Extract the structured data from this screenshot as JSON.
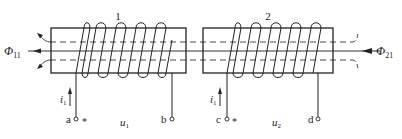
{
  "diagram": {
    "type": "two coupled coils on separate cores (mutual inductance / dot convention)",
    "colors": {
      "stroke": "#222222",
      "background": "#ffffff"
    },
    "coils": [
      {
        "id": "coil-1",
        "label": "1",
        "turns": 5,
        "terminals": [
          {
            "name": "a",
            "dot_mark": "*"
          },
          {
            "name": "b"
          }
        ],
        "current": {
          "symbol": "i",
          "subscript": "1"
        },
        "voltage": {
          "symbol": "u",
          "subscript": "1"
        },
        "flux": {
          "symbol": "Φ",
          "subscript": "11",
          "direction": "left"
        }
      },
      {
        "id": "coil-2",
        "label": "2",
        "turns": 5,
        "terminals": [
          {
            "name": "c",
            "dot_mark": "*"
          },
          {
            "name": "d"
          }
        ],
        "current": {
          "symbol": "i",
          "subscript": "1"
        },
        "voltage": {
          "symbol": "u",
          "subscript": "2"
        },
        "flux": {
          "symbol": "Φ",
          "subscript": "21",
          "direction": "left"
        }
      }
    ]
  },
  "labels": {
    "coil1_number": "1",
    "coil2_number": "2",
    "flux_left_symbol": "Φ",
    "flux_left_sub": "11",
    "flux_right_symbol": "Φ",
    "flux_right_sub": "21",
    "current1_symbol": "i",
    "current1_sub": "1",
    "current2_symbol": "i",
    "current2_sub": "1",
    "term_a": "a",
    "term_b": "b",
    "term_c": "c",
    "term_d": "d",
    "dot_a": "*",
    "dot_c": "*",
    "voltage1_symbol": "u",
    "voltage1_sub": "1",
    "voltage2_symbol": "u",
    "voltage2_sub": "2"
  }
}
